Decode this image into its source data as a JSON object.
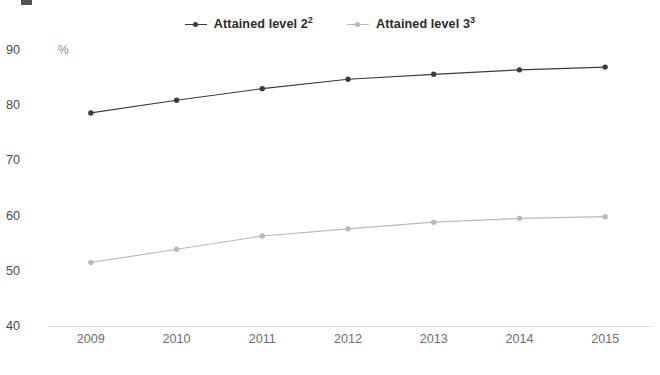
{
  "chart_data": {
    "type": "line",
    "title": "",
    "subtitle": "",
    "xlabel": "",
    "ylabel": "%",
    "categories": [
      "2009",
      "2010",
      "2011",
      "2012",
      "2013",
      "2014",
      "2015"
    ],
    "x": [
      2009,
      2010,
      2011,
      2012,
      2013,
      2014,
      2015
    ],
    "ylim": [
      40,
      90
    ],
    "yticks": [
      40,
      50,
      60,
      70,
      80,
      90
    ],
    "ytick_labels": [
      "40",
      "50",
      "60",
      "70",
      "80",
      "90"
    ],
    "grid": false,
    "legend_position": "top-center",
    "series": [
      {
        "name": "Attained level 2",
        "name_superscript": "2",
        "legend_label_base": "Attained level 2",
        "color": "#3c3c3c",
        "marker": "circle",
        "values": [
          78.6,
          80.9,
          83.0,
          84.7,
          85.6,
          86.4,
          86.9
        ]
      },
      {
        "name": "Attained level 3",
        "name_superscript": "3",
        "legend_label_base": "Attained level 3",
        "color": "#b9b9b9",
        "marker": "circle",
        "values": [
          51.5,
          53.9,
          56.3,
          57.6,
          58.8,
          59.5,
          59.8
        ]
      }
    ],
    "axis_color": "#dedede",
    "ytick_color": "#4a4a4a",
    "xtick_color": "#6d6d6d"
  }
}
